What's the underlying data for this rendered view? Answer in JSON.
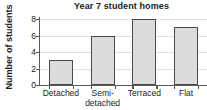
{
  "chart_data": {
    "type": "bar",
    "title": "Year 7 student homes",
    "xlabel": "",
    "ylabel": "Number of students",
    "categories": [
      "Detached",
      "Semi-detached",
      "Terraced",
      "Flat"
    ],
    "category_labels_display": [
      "Detached",
      "Semi-\ndetached",
      "Terraced",
      "Flat"
    ],
    "values": [
      3,
      6,
      8,
      7
    ],
    "ylim": [
      0,
      8
    ],
    "yticks": [
      0,
      2,
      4,
      6,
      8
    ],
    "ytick_labels": [
      "0",
      "2",
      "4",
      "6",
      "8"
    ],
    "grid": true,
    "legend": false,
    "bar_fill_color": "#dcdcdc",
    "bar_edge_color": "#4a4a4a",
    "axis_color": "#5a5a5a",
    "gridline_color": "#e2e2e2",
    "background_color": "#ffffff"
  }
}
